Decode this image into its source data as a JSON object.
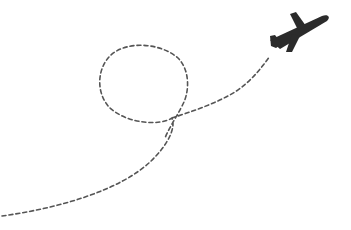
{
  "illustration": {
    "subject": "airplane flying along dashed looping flight path",
    "icon": "airplane-icon",
    "path_style": "dashed",
    "colors": {
      "background": "#ffffff",
      "plane": "#2b2b2b",
      "path": "#555555"
    }
  }
}
